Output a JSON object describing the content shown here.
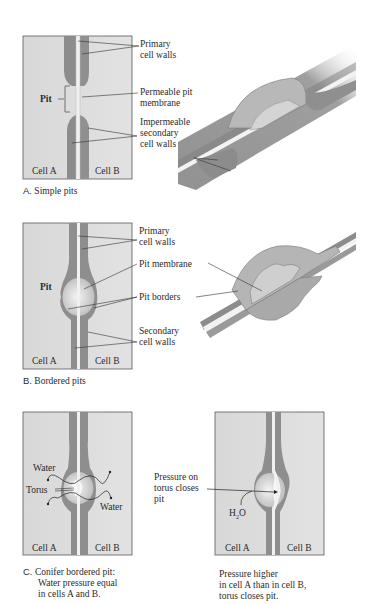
{
  "figure": {
    "panel_a": {
      "caption_letter": "A.",
      "caption_text": "Simple pits",
      "labels": {
        "primary_cell_walls_1": "Primary",
        "primary_cell_walls_2": "cell walls",
        "pit": "Pit",
        "permeable_membrane_1": "Permeable pit",
        "permeable_membrane_2": "membrane",
        "secondary_walls_1": "Impermeable",
        "secondary_walls_2": "secondary",
        "secondary_walls_3": "cell walls",
        "cell_a": "Cell A",
        "cell_b": "Cell B"
      }
    },
    "panel_b": {
      "caption_letter": "B.",
      "caption_text": "Bordered pits",
      "labels": {
        "primary_cell_walls_1": "Primary",
        "primary_cell_walls_2": "cell walls",
        "pit": "Pit",
        "pit_membrane": "Pit membrane",
        "pit_borders": "Pit borders",
        "secondary_walls_1": "Secondary",
        "secondary_walls_2": "cell walls",
        "cell_a": "Cell A",
        "cell_b": "Cell B"
      }
    },
    "panel_c": {
      "caption_letter": "C.",
      "caption_line_1": "Conifer bordered pit:",
      "caption_line_2": "Water pressure equal",
      "caption_line_3": "in cells A and B.",
      "labels": {
        "water_top": "Water",
        "torus": "Torus",
        "water_bottom": "Water",
        "cell_a": "Cell A",
        "cell_b": "Cell B"
      }
    },
    "panel_d": {
      "caption_line_1": "Pressure higher",
      "caption_line_2": "in cell A than in cell B,",
      "caption_line_3": "torus closes pit.",
      "labels": {
        "pressure_1": "Pressure on",
        "pressure_2": "torus closes",
        "pressure_3": "pit",
        "h2o": "H",
        "h2o_sub": "2",
        "h2o_o": "O",
        "cell_a": "Cell A",
        "cell_b": "Cell B"
      }
    },
    "colors": {
      "panel_bg": "#dcdcdc",
      "secondary_wall": "#8f8f8f",
      "primary_wall": "#f2f2f2",
      "pit_interior": "#e8e8e8",
      "border": "#555555"
    }
  }
}
